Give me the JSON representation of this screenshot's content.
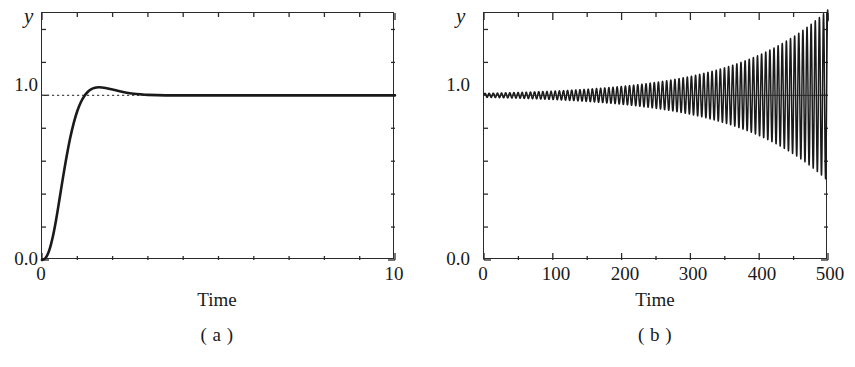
{
  "figure": {
    "background_color": "#ffffff",
    "line_color": "#1a1a1a",
    "axis_color": "#2b2b2b",
    "reference_line_color": "#4d4d4d"
  },
  "panels": [
    {
      "id": "a",
      "caption": "( a )",
      "y_axis_symbol": "y",
      "x_axis_title": "Time",
      "y_tick_labels": [
        "1.0",
        "0.0"
      ],
      "x_tick_labels": [
        "0",
        "10"
      ]
    },
    {
      "id": "b",
      "caption": "( b )",
      "y_axis_symbol": "y",
      "x_axis_title": "Time",
      "y_tick_labels": [
        "1.0",
        "0.0"
      ],
      "x_tick_labels": [
        "0",
        "100",
        "200",
        "300",
        "400",
        "500"
      ]
    }
  ],
  "chart_data": [
    {
      "type": "line",
      "id": "panel-a",
      "title": "( a )",
      "xlabel": "Time",
      "ylabel": "y",
      "xlim": [
        0,
        10
      ],
      "ylim": [
        0,
        1.5
      ],
      "xticks": [
        0,
        10
      ],
      "xticks_minor": [
        1,
        2,
        3,
        4,
        5,
        6,
        7,
        8,
        9
      ],
      "yticks": [
        0.0,
        1.0
      ],
      "yticks_minor": [
        0.2,
        0.4,
        0.6,
        0.8,
        1.2,
        1.4
      ],
      "grid": false,
      "legend": null,
      "description": "Damped step response that rises from 0, overshoots to about 1.07 near t=1.2, and settles at the steady-state value 1.0.",
      "reference_line": {
        "y": 1.0,
        "style": "dotted"
      },
      "series": [
        {
          "name": "step response",
          "style": "solid",
          "x": [
            0,
            0.1,
            0.2,
            0.3,
            0.4,
            0.5,
            0.6,
            0.7,
            0.8,
            0.9,
            1.0,
            1.1,
            1.2,
            1.3,
            1.4,
            1.5,
            1.6,
            1.7,
            1.8,
            1.9,
            2.0,
            2.2,
            2.4,
            2.6,
            2.8,
            3.0,
            3.5,
            4.0,
            4.5,
            5.0,
            6.0,
            7.0,
            8.0,
            9.0,
            10.0
          ],
          "y": [
            0.0,
            0.012,
            0.055,
            0.135,
            0.245,
            0.375,
            0.508,
            0.632,
            0.742,
            0.833,
            0.905,
            0.958,
            0.996,
            1.022,
            1.038,
            1.046,
            1.049,
            1.048,
            1.045,
            1.04,
            1.035,
            1.025,
            1.016,
            1.01,
            1.006,
            1.003,
            1.0,
            1.0,
            1.0,
            1.0,
            1.0,
            1.0,
            1.0,
            1.0,
            1.0
          ]
        }
      ]
    },
    {
      "type": "line",
      "id": "panel-b",
      "title": "( b )",
      "xlabel": "Time",
      "ylabel": "y",
      "xlim": [
        0,
        500
      ],
      "ylim": [
        0,
        1.5
      ],
      "xticks": [
        0,
        100,
        200,
        300,
        400,
        500
      ],
      "xticks_minor": [
        50,
        150,
        250,
        350,
        450
      ],
      "yticks": [
        0.0,
        1.0
      ],
      "yticks_minor": [
        0.2,
        0.4,
        0.6,
        0.8,
        1.2,
        1.4
      ],
      "grid": false,
      "legend": null,
      "description": "Unstable oscillation about the value 1.0 whose amplitude grows exponentially with time, filling the full vertical range of the axes by t=500.",
      "reference_line": {
        "y": 1.0,
        "style": "solid-thin"
      },
      "oscillation": {
        "center": 1.0,
        "period": 6.0,
        "amplitude_at_t0": 0.012,
        "amplitude_at_t500": 0.52,
        "growth": "exponential"
      }
    }
  ]
}
